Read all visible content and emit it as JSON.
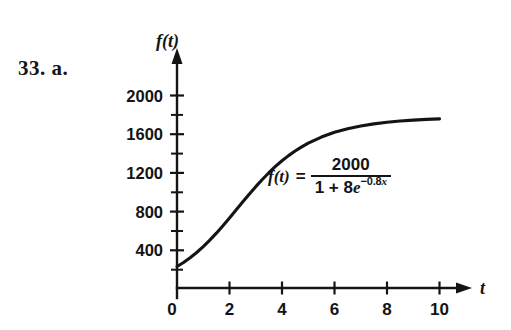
{
  "problem": {
    "label": "33. a."
  },
  "equation": {
    "lhs": "f(t)",
    "equals": "=",
    "numerator": "2000",
    "denominator_prefix": "1 + 8",
    "denominator_e": "e",
    "exponent_sign": "−0.8",
    "exponent_var": "x",
    "plain": "f(t) = 2000 / (1 + 8e^(-0.8x))"
  },
  "chart_data": {
    "type": "line",
    "title": "",
    "subtitle": "",
    "xlabel": "t",
    "ylabel": "f(t)",
    "xlim": [
      0,
      11.2
    ],
    "ylim": [
      0,
      2150
    ],
    "grid": false,
    "legend": null,
    "x_ticks": [
      0,
      2,
      4,
      6,
      8,
      10
    ],
    "x_tick_labels": [
      "0",
      "2",
      "4",
      "6",
      "8",
      "10"
    ],
    "x_minor_ticks": [],
    "y_ticks": [
      400,
      800,
      1200,
      1600,
      2000
    ],
    "y_tick_labels": [
      "400",
      "800",
      "1200",
      "1600",
      "2000"
    ],
    "y_minor_ticks": [
      200,
      600,
      1000,
      1400,
      1800
    ],
    "axis_arrows": [
      "x-right",
      "y-up"
    ],
    "series": [
      {
        "name": "f(t) = 2000/(1 + 8e^(-0.8t))",
        "color": "#141414",
        "x": [
          0,
          0.25,
          0.5,
          0.75,
          1,
          1.25,
          1.5,
          1.75,
          2,
          2.25,
          2.5,
          2.75,
          3,
          3.25,
          3.5,
          3.75,
          4,
          4.25,
          4.5,
          4.75,
          5,
          5.5,
          6,
          6.5,
          7,
          7.5,
          8,
          8.5,
          9,
          9.5,
          10
        ],
        "y": [
          222,
          264,
          313,
          367,
          428,
          495,
          567,
          644,
          724,
          806,
          889,
          970,
          1048,
          1122,
          1192,
          1257,
          1316,
          1369,
          1417,
          1460,
          1498,
          1561,
          1610,
          1647,
          1676,
          1697,
          1714,
          1727,
          1736,
          1744,
          1749
        ]
      }
    ],
    "annotations": [
      {
        "text": "f(t) = 2000 / (1 + 8e^(-0.8x))",
        "x": 4.0,
        "y": 1250
      }
    ]
  }
}
